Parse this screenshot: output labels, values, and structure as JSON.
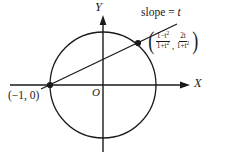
{
  "figure": {
    "type": "geometry-diagram",
    "background": "#ffffff",
    "stroke_color": "#1a1a1a",
    "width": 227,
    "height": 158
  },
  "axes": {
    "x_label": "X",
    "y_label": "Y",
    "origin_label": "O",
    "x_axis": {
      "x1": 10,
      "y1": 85,
      "x2": 190,
      "y2": 85,
      "arrow": "right"
    },
    "y_axis": {
      "x1": 103,
      "y1": 16,
      "x2": 103,
      "y2": 152,
      "arrow": "up"
    }
  },
  "circle": {
    "center_x": 103,
    "center_y": 85,
    "radius": 53,
    "equation_note": "unit circle"
  },
  "points": [
    {
      "name": "left-intersection",
      "label": "(−1, 0)",
      "cx": 50,
      "cy": 85,
      "marker": "filled-dot"
    },
    {
      "name": "parametrized-point",
      "label_part1_num": "1−t",
      "label_part1_den": "1+t",
      "label_part2_num": "2t",
      "label_part2_den": "1+t",
      "exponent": "2",
      "cx": 138,
      "cy": 43,
      "marker": "filled-dot"
    }
  ],
  "line": {
    "name": "secant-line",
    "label_text": "slope = ",
    "label_var": "t",
    "x1": 41,
    "y1": 89,
    "x2": 177,
    "y2": 24
  },
  "coordinate_label": {
    "open_paren": "(",
    "close_paren": ")",
    "separator": ",",
    "x_num_base": "1−t",
    "x_num_exp": "2",
    "x_den_base": "1+t",
    "x_den_exp": "2",
    "y_num": "2t",
    "y_den_base": "1+t",
    "y_den_exp": "2"
  }
}
